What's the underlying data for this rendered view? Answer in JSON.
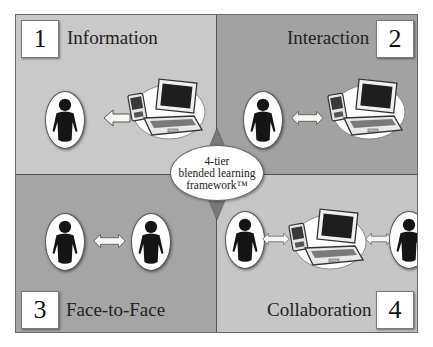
{
  "diagram": {
    "center_label_lines": [
      "4-tier",
      "blended learning",
      "framework™"
    ],
    "quadrants": [
      {
        "number": "1",
        "label": "Information",
        "relation": "one-way arrow from device to person",
        "background": "#c9c9c9"
      },
      {
        "number": "2",
        "label": "Interaction",
        "relation": "two-way arrow between person and device",
        "background": "#a2a2a2"
      },
      {
        "number": "3",
        "label": "Face-to-Face",
        "relation": "two-way arrow between two persons",
        "background": "#a5a5a5"
      },
      {
        "number": "4",
        "label": "Collaboration",
        "relation": "person ↔ device ↔ person",
        "background": "#c6c6c6"
      }
    ],
    "icons": [
      "person-icon",
      "laptop-icon",
      "pda-icon",
      "left-arrow-icon",
      "double-arrow-icon"
    ],
    "colors": {
      "light_quadrant": "#c9c9c9",
      "dark_quadrant": "#a2a2a2",
      "diamond": "#7a7a7a",
      "person": "#1a1a1a"
    }
  }
}
